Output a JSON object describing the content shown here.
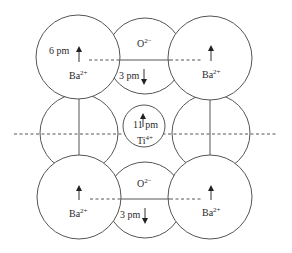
{
  "diagram": {
    "title": "",
    "colors": {
      "stroke": "#555555",
      "text": "#2a2a2a",
      "background": "#ffffff"
    },
    "ions": {
      "ba_top_left": {
        "label": "Ba",
        "charge": "2+",
        "displacement": "6 pm",
        "direction": "up"
      },
      "ba_top_right": {
        "label": "Ba",
        "charge": "2+",
        "direction": "up"
      },
      "ba_bottom_left": {
        "label": "Ba",
        "charge": "2+",
        "direction": "up"
      },
      "ba_bottom_right": {
        "label": "Ba",
        "charge": "2+",
        "direction": "up"
      },
      "o_top": {
        "label": "O",
        "charge": "2−",
        "displacement": "3 pm",
        "direction": "down"
      },
      "o_bottom": {
        "label": "O",
        "charge": "2−",
        "displacement": "3 pm",
        "direction": "down"
      },
      "o_left": {
        "label": "O",
        "charge": "2−"
      },
      "o_right": {
        "label": "O",
        "charge": "2−"
      },
      "ti_center": {
        "label": "Ti",
        "charge": "4+",
        "displacement": "11 pm",
        "direction": "up"
      }
    },
    "reference_lines": {
      "horizontal_center": "dashed",
      "top_row": "dashed+solid",
      "bottom_row": "dashed+solid"
    }
  }
}
